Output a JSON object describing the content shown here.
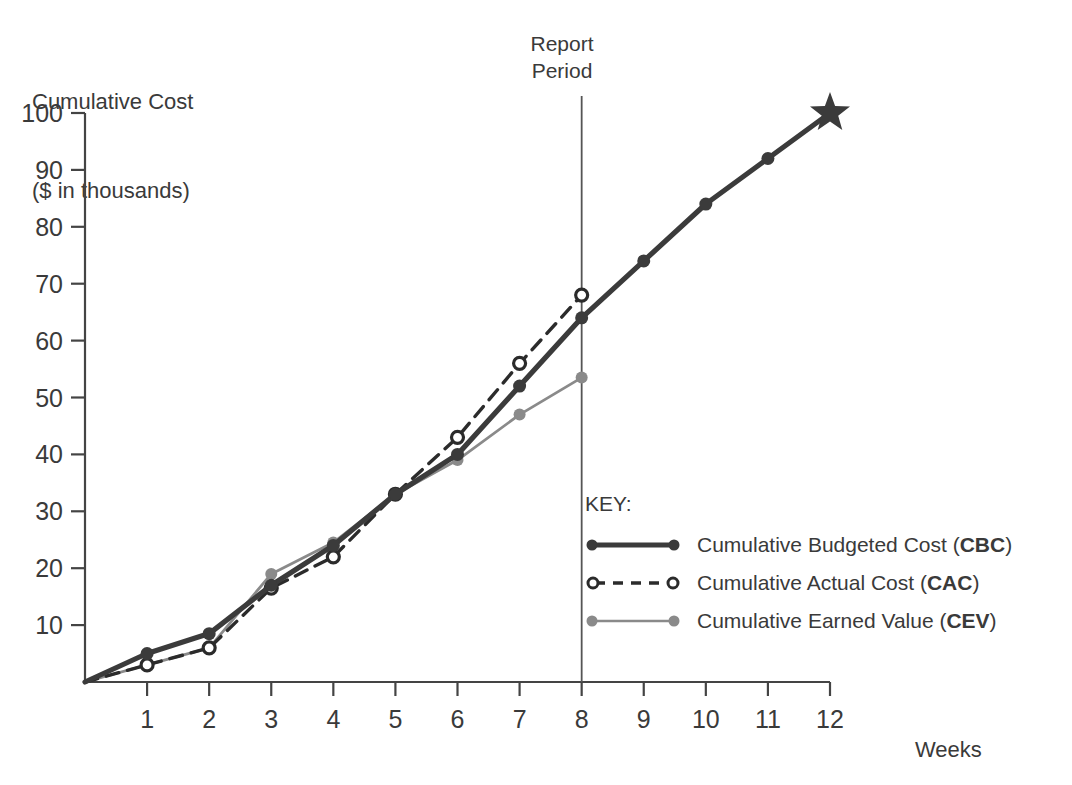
{
  "chart_data": {
    "type": "line",
    "title": "",
    "xlabel": "Weeks",
    "ylabel": "Cumulative Cost\n($ in thousands)",
    "ylabel_line1": "Cumulative Cost",
    "ylabel_line2": "($ in thousands)",
    "xlim": [
      0,
      12
    ],
    "ylim": [
      0,
      100
    ],
    "ytick_values": [
      10,
      20,
      30,
      40,
      50,
      60,
      70,
      80,
      90,
      100
    ],
    "ytick_labels": [
      "10",
      "20",
      "30",
      "40",
      "50",
      "60",
      "70",
      "80",
      "90",
      "100"
    ],
    "xtick_values": [
      1,
      2,
      3,
      4,
      5,
      6,
      7,
      8,
      9,
      10,
      11,
      12
    ],
    "xtick_labels": [
      "1",
      "2",
      "3",
      "4",
      "5",
      "6",
      "7",
      "8",
      "9",
      "10",
      "11",
      "12"
    ],
    "grid": false,
    "legend_position": "inside-lower-right",
    "x": [
      0,
      1,
      2,
      3,
      4,
      5,
      6,
      7,
      8,
      9,
      10,
      11,
      12
    ],
    "series": [
      {
        "name": "Cumulative Budgeted Cost (CBC)",
        "abbr": "CBC",
        "label_plain": "Cumulative Budgeted Cost",
        "color": "#3b3b3b",
        "style": "solid-thick-filled-dot",
        "x": [
          0,
          1,
          2,
          3,
          4,
          5,
          6,
          7,
          8,
          9,
          10,
          11,
          12
        ],
        "values": [
          0,
          5,
          8.5,
          17,
          24,
          33,
          40,
          52,
          64,
          74,
          84,
          92,
          100
        ],
        "end_marker": "star"
      },
      {
        "name": "Cumulative Actual Cost (CAC)",
        "abbr": "CAC",
        "label_plain": "Cumulative Actual Cost",
        "color": "#2b2b2b",
        "style": "dashed-hollow-circle",
        "x": [
          0,
          1,
          2,
          3,
          4,
          5,
          6,
          7,
          8
        ],
        "values": [
          0,
          3,
          6,
          16.5,
          22,
          33,
          43,
          56,
          68
        ]
      },
      {
        "name": "Cumulative Earned Value (CEV)",
        "abbr": "CEV",
        "label_plain": "Cumulative Earned Value",
        "color": "#8a8a8a",
        "style": "solid-thin-gray-dot",
        "x": [
          0,
          1,
          2,
          3,
          4,
          5,
          6,
          7,
          8
        ],
        "values": [
          0,
          3,
          6,
          19,
          24.5,
          33,
          39,
          47,
          53.5
        ]
      }
    ],
    "annotations": [
      {
        "name": "report-period",
        "line1": "Report",
        "line2": "Period",
        "x_value": 8,
        "type": "vertical-line-with-text"
      }
    ]
  },
  "legend": {
    "title": "KEY:",
    "items": [
      {
        "label_plain": "Cumulative Budgeted Cost",
        "abbr": "CBC"
      },
      {
        "label_plain": "Cumulative Actual Cost",
        "abbr": "CAC"
      },
      {
        "label_plain": "Cumulative Earned Value",
        "abbr": "CEV"
      }
    ]
  },
  "colors": {
    "cbc": "#3b3b3b",
    "cac": "#2b2b2b",
    "cev": "#8a8a8a",
    "axis": "#444444",
    "text": "#3a3a3a"
  }
}
